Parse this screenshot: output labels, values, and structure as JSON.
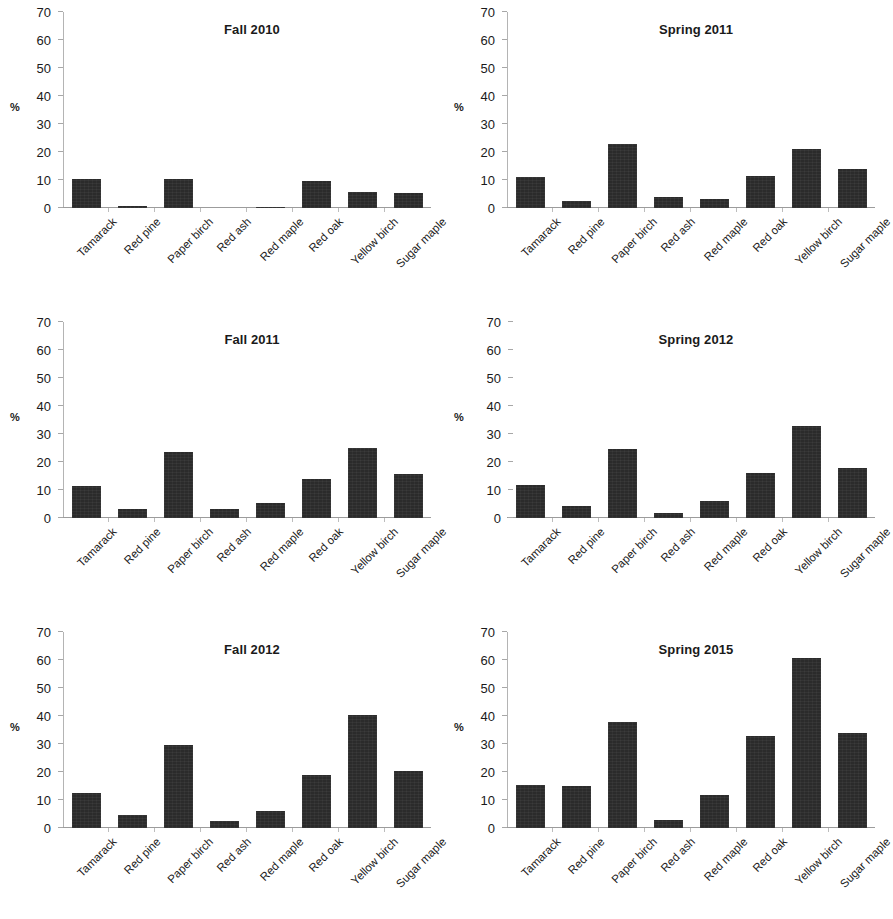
{
  "figure": {
    "axis_unit_label": "%",
    "bar_color": "#2b2b2b",
    "axis_color": "#b4b4b4",
    "text_color": "#1a1a1a"
  },
  "categories": [
    "Tamarack",
    "Red pine",
    "Paper birch",
    "Red ash",
    "Red maple",
    "Red oak",
    "Yellow birch",
    "Sugar maple"
  ],
  "yticks": [
    0,
    10,
    20,
    30,
    40,
    50,
    60,
    70
  ],
  "ylim": [
    0,
    70
  ],
  "chart_data": [
    {
      "type": "bar",
      "title": "Fall 2010",
      "xlabel": "",
      "ylabel": "%",
      "ylim": [
        0,
        70
      ],
      "yticks": [
        0,
        10,
        20,
        30,
        40,
        50,
        60,
        70
      ],
      "grid": false,
      "legend": "none",
      "axis_style": "spine",
      "categories": [
        "Tamarack",
        "Red pine",
        "Paper birch",
        "Red ash",
        "Red maple",
        "Red oak",
        "Yellow birch",
        "Sugar maple"
      ],
      "values": [
        10.3,
        0.8,
        10.4,
        0,
        0.5,
        9.5,
        5.8,
        5.3
      ]
    },
    {
      "type": "bar",
      "title": "Spring 2011",
      "xlabel": "",
      "ylabel": "%",
      "ylim": [
        0,
        70
      ],
      "yticks": [
        0,
        10,
        20,
        30,
        40,
        50,
        60,
        70
      ],
      "grid": false,
      "legend": "none",
      "axis_style": "spine",
      "categories": [
        "Tamarack",
        "Red pine",
        "Paper birch",
        "Red ash",
        "Red maple",
        "Red oak",
        "Yellow birch",
        "Sugar maple"
      ],
      "values": [
        10.9,
        2.5,
        22.9,
        3.9,
        3.3,
        11.5,
        21.2,
        13.9
      ]
    },
    {
      "type": "bar",
      "title": "Fall 2011",
      "xlabel": "",
      "ylabel": "%",
      "ylim": [
        0,
        70
      ],
      "yticks": [
        0,
        10,
        20,
        30,
        40,
        50,
        60,
        70
      ],
      "grid": false,
      "legend": "none",
      "axis_style": "spine",
      "categories": [
        "Tamarack",
        "Red pine",
        "Paper birch",
        "Red ash",
        "Red maple",
        "Red oak",
        "Yellow birch",
        "Sugar maple"
      ],
      "values": [
        11.5,
        3.1,
        23.4,
        3.2,
        5.2,
        13.9,
        25.1,
        15.8
      ]
    },
    {
      "type": "bar",
      "title": "Spring 2012",
      "xlabel": "",
      "ylabel": "%",
      "ylim": [
        0,
        70
      ],
      "yticks": [
        0,
        10,
        20,
        30,
        40,
        50,
        60,
        70
      ],
      "grid": false,
      "legend": "none",
      "axis_style": "ticks-only",
      "categories": [
        "Tamarack",
        "Red pine",
        "Paper birch",
        "Red ash",
        "Red maple",
        "Red oak",
        "Yellow birch",
        "Sugar maple"
      ],
      "values": [
        11.9,
        4.2,
        24.8,
        1.8,
        6.1,
        16.2,
        32.9,
        17.8
      ]
    },
    {
      "type": "bar",
      "title": "Fall 2012",
      "xlabel": "",
      "ylabel": "%",
      "ylim": [
        0,
        70
      ],
      "yticks": [
        0,
        10,
        20,
        30,
        40,
        50,
        60,
        70
      ],
      "grid": false,
      "legend": "none",
      "axis_style": "spine",
      "categories": [
        "Tamarack",
        "Red pine",
        "Paper birch",
        "Red ash",
        "Red maple",
        "Red oak",
        "Yellow birch",
        "Sugar maple"
      ],
      "values": [
        12.4,
        4.5,
        29.8,
        2.6,
        6.0,
        19.0,
        40.3,
        20.3
      ]
    },
    {
      "type": "bar",
      "title": "Spring 2015",
      "xlabel": "",
      "ylabel": "%",
      "ylim": [
        0,
        70
      ],
      "yticks": [
        0,
        10,
        20,
        30,
        40,
        50,
        60,
        70
      ],
      "grid": false,
      "legend": "none",
      "axis_style": "spine",
      "categories": [
        "Tamarack",
        "Red pine",
        "Paper birch",
        "Red ash",
        "Red maple",
        "Red oak",
        "Yellow birch",
        "Sugar maple"
      ],
      "values": [
        15.3,
        15.0,
        37.7,
        2.7,
        11.8,
        33.0,
        60.6,
        34.0
      ]
    }
  ]
}
